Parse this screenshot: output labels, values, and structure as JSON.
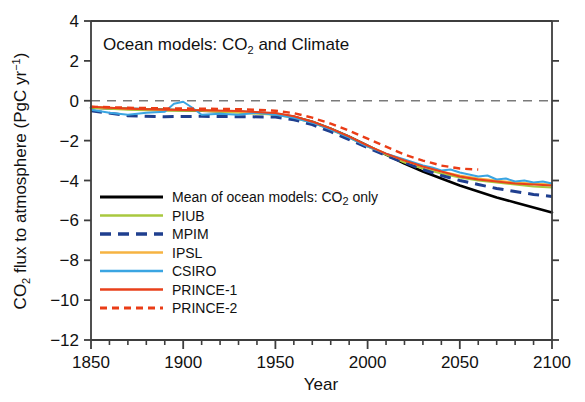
{
  "chart_data": {
    "type": "line",
    "title": "Ocean models: CO2 and Climate",
    "title_parts": {
      "pre": "Ocean models: CO",
      "sub": "2",
      "post": " and Climate"
    },
    "xlabel": "Year",
    "ylabel": "CO2 flux to atmosphere (PgC yr-1)",
    "ylabel_parts": {
      "pre": "CO",
      "sub": "2",
      "mid": " flux to atmosphere (PgC yr",
      "sup": "-1",
      "post": ")"
    },
    "xlim": [
      1850,
      2100
    ],
    "ylim": [
      -12,
      4
    ],
    "xticks": [
      1850,
      1900,
      1950,
      2000,
      2050,
      2100
    ],
    "xtick_labels": [
      "1850",
      "1900",
      "1950",
      "2000",
      "2050",
      "2100"
    ],
    "xminor_step": 10,
    "yticks": [
      4,
      2,
      0,
      -2,
      -4,
      -6,
      -8,
      -10,
      -12
    ],
    "ytick_labels": [
      "4",
      "2",
      "0",
      "-2",
      "-4",
      "-6",
      "-8",
      "-10",
      "-12"
    ],
    "grid": false,
    "zero_line": {
      "value": 0,
      "style": "dashed",
      "color": "#7a7a7a"
    },
    "legend_position": "lower left",
    "series": [
      {
        "name": "Mean of ocean models: CO2 only",
        "label_parts": {
          "pre": "Mean of ocean models: CO",
          "sub": "2",
          "post": " only"
        },
        "color": "#000000",
        "style": "solid",
        "width": 2.6,
        "x": [
          1850,
          1870,
          1890,
          1910,
          1930,
          1950,
          1960,
          1970,
          1980,
          1990,
          2000,
          2010,
          2020,
          2030,
          2040,
          2050,
          2060,
          2070,
          2080,
          2090,
          2100
        ],
        "y": [
          -0.35,
          -0.4,
          -0.45,
          -0.5,
          -0.55,
          -0.65,
          -0.8,
          -1.05,
          -1.4,
          -1.8,
          -2.25,
          -2.7,
          -3.15,
          -3.55,
          -3.9,
          -4.25,
          -4.55,
          -4.85,
          -5.1,
          -5.35,
          -5.6
        ]
      },
      {
        "name": "PIUB",
        "color": "#a9c83f",
        "style": "solid",
        "width": 2.0,
        "x": [
          1850,
          1870,
          1890,
          1910,
          1930,
          1950,
          1960,
          1970,
          1980,
          1990,
          2000,
          2010,
          2020,
          2030,
          2040,
          2050,
          2060,
          2070,
          2080,
          2090,
          2100
        ],
        "y": [
          -0.35,
          -0.45,
          -0.5,
          -0.5,
          -0.6,
          -0.7,
          -0.85,
          -1.1,
          -1.45,
          -1.85,
          -2.3,
          -2.7,
          -3.1,
          -3.4,
          -3.65,
          -3.85,
          -4.0,
          -4.1,
          -4.2,
          -4.3,
          -4.35
        ]
      },
      {
        "name": "MPIM",
        "color": "#1f3f8f",
        "style": "dashed",
        "width": 3.0,
        "x": [
          1850,
          1870,
          1890,
          1910,
          1930,
          1950,
          1960,
          1970,
          1980,
          1990,
          2000,
          2010,
          2020,
          2030,
          2040,
          2050,
          2060,
          2070,
          2080,
          2090,
          2100
        ],
        "y": [
          -0.5,
          -0.75,
          -0.8,
          -0.78,
          -0.8,
          -0.82,
          -0.95,
          -1.2,
          -1.55,
          -1.95,
          -2.35,
          -2.75,
          -3.1,
          -3.45,
          -3.75,
          -4.0,
          -4.2,
          -4.4,
          -4.55,
          -4.7,
          -4.8
        ]
      },
      {
        "name": "IPSL",
        "color": "#f6b342",
        "style": "solid",
        "width": 2.0,
        "x": [
          1850,
          1870,
          1890,
          1910,
          1930,
          1950,
          1960,
          1970,
          1980,
          1990,
          2000,
          2010,
          2020,
          2030,
          2040,
          2050,
          2060,
          2070,
          2080,
          2090,
          2100
        ],
        "y": [
          -0.3,
          -0.4,
          -0.45,
          -0.48,
          -0.55,
          -0.65,
          -0.8,
          -1.05,
          -1.4,
          -1.8,
          -2.25,
          -2.65,
          -3.0,
          -3.3,
          -3.55,
          -3.75,
          -3.9,
          -4.0,
          -4.1,
          -4.15,
          -4.2
        ]
      },
      {
        "name": "CSIRO",
        "color": "#3aa5e2",
        "style": "solid",
        "width": 2.0,
        "x": [
          1850,
          1860,
          1870,
          1880,
          1890,
          1895,
          1900,
          1905,
          1910,
          1920,
          1930,
          1940,
          1950,
          1960,
          1970,
          1980,
          1990,
          2000,
          2010,
          2020,
          2030,
          2035,
          2040,
          2045,
          2050,
          2055,
          2060,
          2065,
          2070,
          2075,
          2080,
          2085,
          2090,
          2095,
          2100
        ],
        "y": [
          -0.45,
          -0.6,
          -0.7,
          -0.6,
          -0.55,
          -0.15,
          -0.05,
          -0.35,
          -0.7,
          -0.65,
          -0.7,
          -0.6,
          -0.7,
          -0.85,
          -1.1,
          -1.45,
          -1.85,
          -2.3,
          -2.65,
          -2.95,
          -3.25,
          -3.35,
          -3.5,
          -3.45,
          -3.6,
          -3.7,
          -3.8,
          -3.75,
          -3.95,
          -3.9,
          -4.05,
          -4.0,
          -4.1,
          -4.05,
          -4.15
        ]
      },
      {
        "name": "PRINCE-1",
        "color": "#e8411b",
        "style": "solid",
        "width": 2.0,
        "x": [
          1850,
          1870,
          1890,
          1910,
          1930,
          1950,
          1960,
          1970,
          1980,
          1990,
          2000,
          2010,
          2020,
          2030,
          2040,
          2050,
          2060,
          2070,
          2080,
          2090,
          2100
        ],
        "y": [
          -0.3,
          -0.4,
          -0.45,
          -0.48,
          -0.52,
          -0.62,
          -0.78,
          -1.05,
          -1.4,
          -1.8,
          -2.25,
          -2.65,
          -3.0,
          -3.3,
          -3.55,
          -3.8,
          -3.95,
          -4.05,
          -4.15,
          -4.2,
          -4.25
        ]
      },
      {
        "name": "PRINCE-2",
        "color": "#ea3c16",
        "style": "dashed",
        "width": 2.4,
        "x": [
          1850,
          1870,
          1890,
          1910,
          1930,
          1950,
          1960,
          1970,
          1980,
          1990,
          2000,
          2010,
          2020,
          2030,
          2040,
          2050,
          2060
        ],
        "y": [
          -0.3,
          -0.35,
          -0.38,
          -0.4,
          -0.42,
          -0.5,
          -0.62,
          -0.85,
          -1.15,
          -1.5,
          -1.9,
          -2.3,
          -2.7,
          -3.0,
          -3.25,
          -3.4,
          -3.45
        ]
      }
    ]
  }
}
